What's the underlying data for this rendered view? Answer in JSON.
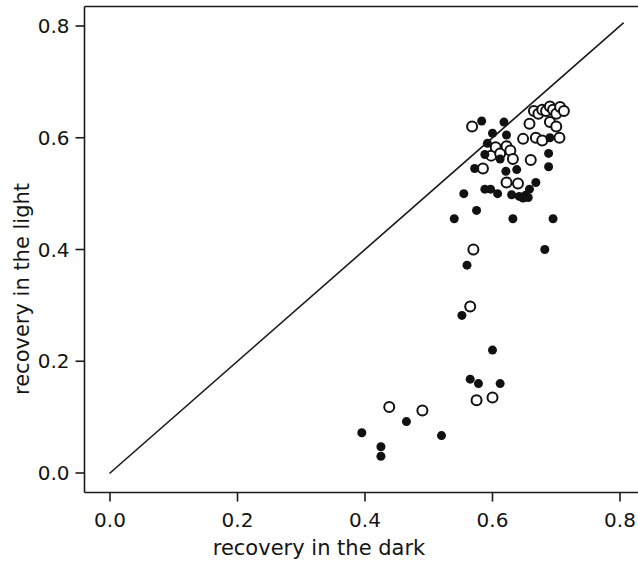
{
  "chart_data": {
    "type": "scatter",
    "title": "",
    "xlabel": "recovery in the dark",
    "ylabel": "recovery in the light",
    "xlim": [
      -0.04,
      0.83
    ],
    "ylim": [
      -0.035,
      0.835
    ],
    "xticks": [
      0.0,
      0.2,
      0.4,
      0.6,
      0.8
    ],
    "xtick_labels": [
      "0.0",
      "0.2",
      "0.4",
      "0.6",
      "0.8"
    ],
    "yticks": [
      0.0,
      0.2,
      0.4,
      0.6,
      0.8
    ],
    "ytick_labels": [
      "0.0",
      "0.2",
      "0.4",
      "0.6",
      "0.8"
    ],
    "grid": false,
    "legend": null,
    "annotations": [],
    "reference_line": {
      "name": "identity-line",
      "description": "y = x diagonal line",
      "x": [
        0.0,
        0.805
      ],
      "y": [
        0.0,
        0.805
      ],
      "color": "#1a1a1a",
      "width": 1.6
    },
    "series": [
      {
        "name": "filled",
        "marker": "filled-circle",
        "color": "#111111",
        "fill": "#111111",
        "size": 9,
        "points": [
          [
            0.395,
            0.072
          ],
          [
            0.425,
            0.047
          ],
          [
            0.425,
            0.03
          ],
          [
            0.465,
            0.092
          ],
          [
            0.52,
            0.067
          ],
          [
            0.552,
            0.282
          ],
          [
            0.56,
            0.372
          ],
          [
            0.565,
            0.168
          ],
          [
            0.578,
            0.16
          ],
          [
            0.6,
            0.22
          ],
          [
            0.612,
            0.16
          ],
          [
            0.575,
            0.47
          ],
          [
            0.588,
            0.508
          ],
          [
            0.597,
            0.508
          ],
          [
            0.572,
            0.545
          ],
          [
            0.588,
            0.57
          ],
          [
            0.592,
            0.59
          ],
          [
            0.583,
            0.63
          ],
          [
            0.6,
            0.608
          ],
          [
            0.618,
            0.628
          ],
          [
            0.622,
            0.605
          ],
          [
            0.612,
            0.562
          ],
          [
            0.621,
            0.54
          ],
          [
            0.638,
            0.543
          ],
          [
            0.608,
            0.5
          ],
          [
            0.63,
            0.498
          ],
          [
            0.642,
            0.495
          ],
          [
            0.648,
            0.492
          ],
          [
            0.652,
            0.497
          ],
          [
            0.656,
            0.493
          ],
          [
            0.658,
            0.508
          ],
          [
            0.632,
            0.455
          ],
          [
            0.668,
            0.52
          ],
          [
            0.688,
            0.572
          ],
          [
            0.69,
            0.6
          ],
          [
            0.688,
            0.548
          ],
          [
            0.695,
            0.455
          ],
          [
            0.682,
            0.4
          ],
          [
            0.54,
            0.455
          ],
          [
            0.555,
            0.5
          ]
        ]
      },
      {
        "name": "open",
        "marker": "open-circle",
        "color": "#111111",
        "fill": "none",
        "size": 9,
        "size_open": 10,
        "points": [
          [
            0.438,
            0.118
          ],
          [
            0.49,
            0.112
          ],
          [
            0.575,
            0.13
          ],
          [
            0.6,
            0.135
          ],
          [
            0.565,
            0.298
          ],
          [
            0.57,
            0.4
          ],
          [
            0.585,
            0.545
          ],
          [
            0.598,
            0.568
          ],
          [
            0.605,
            0.583
          ],
          [
            0.612,
            0.572
          ],
          [
            0.622,
            0.585
          ],
          [
            0.628,
            0.577
          ],
          [
            0.622,
            0.52
          ],
          [
            0.632,
            0.562
          ],
          [
            0.64,
            0.518
          ],
          [
            0.648,
            0.598
          ],
          [
            0.658,
            0.625
          ],
          [
            0.665,
            0.648
          ],
          [
            0.672,
            0.643
          ],
          [
            0.678,
            0.65
          ],
          [
            0.684,
            0.648
          ],
          [
            0.69,
            0.656
          ],
          [
            0.695,
            0.65
          ],
          [
            0.7,
            0.643
          ],
          [
            0.668,
            0.6
          ],
          [
            0.678,
            0.595
          ],
          [
            0.69,
            0.628
          ],
          [
            0.7,
            0.62
          ],
          [
            0.706,
            0.655
          ],
          [
            0.712,
            0.648
          ],
          [
            0.705,
            0.6
          ],
          [
            0.568,
            0.62
          ],
          [
            0.66,
            0.56
          ]
        ]
      }
    ]
  },
  "axes": {
    "x_title": "recovery in the dark",
    "y_title": "recovery in the light",
    "x_labels": [
      "0.0",
      "0.2",
      "0.4",
      "0.6",
      "0.8"
    ],
    "y_labels": [
      "0.0",
      "0.2",
      "0.4",
      "0.6",
      "0.8"
    ]
  },
  "colors": {
    "axis": "#1a1a1a",
    "marker": "#111111",
    "background": "#ffffff"
  }
}
